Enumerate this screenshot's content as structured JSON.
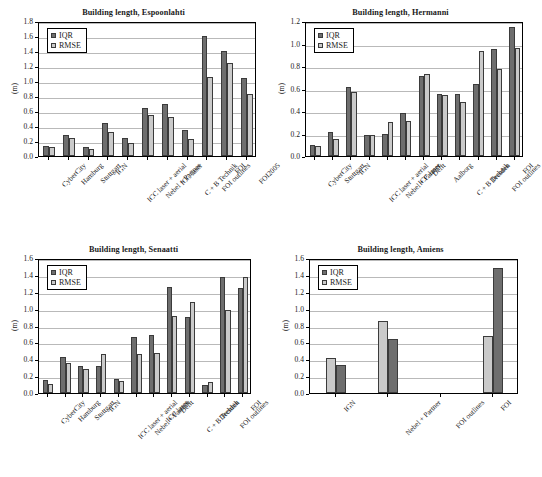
{
  "figure": {
    "background": "#ffffff",
    "series_colors": {
      "IQR": "#6e6e6e",
      "RMSE": "#cacaca"
    },
    "ylabel": "(m)",
    "legend_labels": {
      "iqr": "IQR",
      "rmse": "RMSE"
    }
  },
  "chart_data": [
    {
      "type": "bar",
      "title": "Building length, Espoonlahti",
      "xlabel": "",
      "ylabel": "(m)",
      "ylim": [
        0.0,
        1.8
      ],
      "yticks": [
        "0.0",
        "0.2",
        "0.4",
        "0.6",
        "0.8",
        "1.0",
        "1.2",
        "1.4",
        "1.6",
        "1.8"
      ],
      "grid": true,
      "legend_position": "top-left",
      "categories": [
        "CyberCity",
        "Hamburg",
        "Stuttgart",
        "IGN",
        "ICC laser + aerial",
        "Nebel + Partner",
        "ICC laser",
        "C + B Technik",
        "FOI outlines",
        "FOI",
        "FOI2005"
      ],
      "series": [
        {
          "name": "IQR",
          "values": [
            0.13,
            0.28,
            0.12,
            0.44,
            0.24,
            0.64,
            0.7,
            0.35,
            1.6,
            1.4,
            1.04
          ]
        },
        {
          "name": "RMSE",
          "values": [
            0.12,
            0.24,
            0.1,
            0.32,
            0.17,
            0.55,
            0.52,
            0.23,
            1.06,
            1.24,
            0.83
          ]
        }
      ]
    },
    {
      "type": "bar",
      "title": "Building length, Hermanni",
      "xlabel": "",
      "ylabel": "(m)",
      "ylim": [
        0.0,
        1.2
      ],
      "yticks": [
        "0.0",
        "0.2",
        "0.4",
        "0.6",
        "0.8",
        "1.0",
        "1.2"
      ],
      "grid": true,
      "legend_position": "top-left",
      "categories": [
        "CyberCity",
        "Stuttgart",
        "IGN",
        "ICC laser + aerial",
        "Nebel + Partner",
        "ICC laser",
        "Delft",
        "Aalborg",
        "C + B Technik",
        "Dresden",
        "FOI outlines",
        "FOI"
      ],
      "series": [
        {
          "name": "IQR",
          "values": [
            0.1,
            0.21,
            0.61,
            0.19,
            0.2,
            0.38,
            0.71,
            0.55,
            0.55,
            0.64,
            0.95,
            1.15
          ]
        },
        {
          "name": "RMSE",
          "values": [
            0.09,
            0.15,
            0.57,
            0.19,
            0.3,
            0.31,
            0.73,
            0.54,
            0.48,
            0.93,
            0.77,
            0.96
          ]
        }
      ]
    },
    {
      "type": "bar",
      "title": "Building length, Senaatti",
      "xlabel": "",
      "ylabel": "(m)",
      "ylim": [
        0.0,
        1.6
      ],
      "yticks": [
        "0.0",
        "0.2",
        "0.4",
        "0.6",
        "0.8",
        "1.0",
        "1.2",
        "1.4",
        "1.6"
      ],
      "grid": true,
      "legend_position": "top-left",
      "categories": [
        "CyberCity",
        "Hamburg",
        "Stuttgart",
        "IGN",
        "ICC laser + aerial",
        "Nebel + Partner",
        "ICC laser",
        "Delft",
        "C + B Technik",
        "Dresden",
        "FOI outlines",
        "FOI"
      ],
      "series": [
        {
          "name": "IQR",
          "values": [
            0.16,
            0.43,
            0.32,
            0.32,
            0.17,
            0.66,
            0.69,
            1.26,
            0.9,
            0.1,
            1.38,
            1.24
          ]
        },
        {
          "name": "RMSE",
          "values": [
            0.11,
            0.35,
            0.29,
            0.46,
            0.14,
            0.46,
            0.47,
            0.91,
            1.08,
            0.13,
            0.98,
            1.38
          ]
        }
      ]
    },
    {
      "type": "bar",
      "title": "Building length, Amiens",
      "xlabel": "",
      "ylabel": "(m)",
      "ylim": [
        0.0,
        1.6
      ],
      "yticks": [
        "0.0",
        "0.2",
        "0.4",
        "0.6",
        "0.8",
        "1.0",
        "1.2",
        "1.4",
        "1.6"
      ],
      "grid": true,
      "legend_position": "top-left",
      "bar_order": "rmse-first",
      "categories": [
        "IGN",
        "Nebel + Partner",
        "FOI outlines",
        "FOI"
      ],
      "series": [
        {
          "name": "IQR",
          "values": [
            0.33,
            0.64,
            0.0,
            1.48
          ]
        },
        {
          "name": "RMSE",
          "values": [
            0.41,
            0.85,
            0.0,
            0.68
          ]
        }
      ]
    }
  ]
}
